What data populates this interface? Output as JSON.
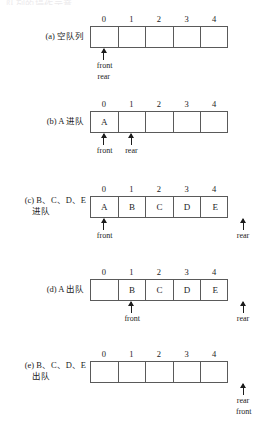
{
  "figure": {
    "cut_off_header": "队列的操作示意",
    "index_labels": [
      "0",
      "1",
      "2",
      "3",
      "4"
    ],
    "pointer_front": "front",
    "pointer_rear": "rear"
  },
  "panels": [
    {
      "caption_line1": "(a) 空队列",
      "caption_line2": "",
      "cells": [
        "",
        "",
        "",
        "",
        ""
      ],
      "pointers": [
        {
          "name": "front-rear-pointer",
          "cell": 0,
          "labels": "front\nrear",
          "side": "below"
        }
      ]
    },
    {
      "caption_line1": "(b) A 进队",
      "caption_line2": "",
      "cells": [
        "A",
        "",
        "",
        "",
        ""
      ],
      "pointers": [
        {
          "name": "front-pointer",
          "cell": 0,
          "labels": "front",
          "side": "below"
        },
        {
          "name": "rear-pointer",
          "cell": 1,
          "labels": "rear",
          "side": "below"
        }
      ]
    },
    {
      "caption_line1": "(c) B、C、D、E",
      "caption_line2": "进队",
      "cells": [
        "A",
        "B",
        "C",
        "D",
        "E"
      ],
      "pointers": [
        {
          "name": "front-pointer",
          "cell": 0,
          "labels": "front",
          "side": "below"
        },
        {
          "name": "rear-pointer",
          "cell": 5,
          "labels": "rear",
          "side": "below-right"
        }
      ]
    },
    {
      "caption_line1": "(d) A 出队",
      "caption_line2": "",
      "cells": [
        "",
        "B",
        "C",
        "D",
        "E"
      ],
      "pointers": [
        {
          "name": "front-pointer",
          "cell": 1,
          "labels": "front",
          "side": "below"
        },
        {
          "name": "rear-pointer",
          "cell": 5,
          "labels": "rear",
          "side": "below-right"
        }
      ]
    },
    {
      "caption_line1": "(e) B、C、D、E",
      "caption_line2": "出队",
      "cells": [
        "",
        "",
        "",
        "",
        ""
      ],
      "pointers": [
        {
          "name": "rear-front-pointer",
          "cell": 5,
          "labels": "rear\nfront",
          "side": "below-right"
        }
      ]
    }
  ],
  "labels": {
    "a_line1": "(a) 空队列",
    "b_line1": "(b) A 进队",
    "c_line1": "(c) B、C、D、E",
    "c_line2": "进队",
    "d_line1": "(d) A 出队",
    "e_line1": "(e) B、C、D、E",
    "e_line2": "出队",
    "idx0": "0",
    "idx1": "1",
    "idx2": "2",
    "idx3": "3",
    "idx4": "4",
    "front": "front",
    "rear": "rear",
    "cellA": "A",
    "cellB": "B",
    "cellC": "C",
    "cellD": "D",
    "cellE": "E",
    "empty": ""
  }
}
